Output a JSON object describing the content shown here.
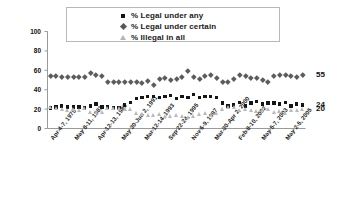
{
  "chart_data": {
    "type": "scatter",
    "title": "",
    "xlabel": "",
    "ylabel": "",
    "ylim": [
      0,
      100
    ],
    "yticks": [
      0,
      20,
      40,
      60,
      80,
      100
    ],
    "grid": false,
    "legend_position": "top-center",
    "legend_entries": [
      "% Legal under any",
      "% Legal under certain",
      "% Illegal in all"
    ],
    "x_tick_labels": [
      "Apr 4-7, 1975",
      "May 8-11, 1981",
      "Apr 12-13, 1989",
      "May 30-Jun 2, 1991",
      "Mar 12-14, 1993",
      "Sep 22-24, 1995",
      "Nov 6-9, 1997",
      "Mar 30-Apr 2, 2000",
      "Feb 8-10, 2002",
      "May 5-7, 2003",
      "May 2-5, 2005"
    ],
    "right_end_labels": [
      "55",
      "24",
      "20"
    ],
    "series": [
      {
        "name": "% Legal under any",
        "marker": "square",
        "color": "#151515",
        "values": [
          21,
          22,
          23,
          22,
          22,
          22,
          21,
          23,
          25,
          22,
          22,
          21,
          21,
          24,
          27,
          31,
          32,
          33,
          33,
          32,
          33,
          34,
          31,
          33,
          32,
          35,
          32,
          33,
          33,
          32,
          26,
          23,
          24,
          27,
          23,
          26,
          28,
          25,
          26,
          26,
          25,
          27,
          23,
          25,
          24
        ]
      },
      {
        "name": "% Legal under certain",
        "marker": "diamond",
        "color": "#5c5c5c",
        "values": [
          54,
          54,
          53,
          53,
          53,
          53,
          53,
          57,
          55,
          54,
          48,
          48,
          48,
          48,
          48,
          48,
          47,
          49,
          45,
          51,
          52,
          50,
          51,
          53,
          59,
          53,
          51,
          54,
          55,
          52,
          48,
          48,
          51,
          55,
          54,
          52,
          52,
          50,
          48,
          54,
          55,
          55,
          54,
          53,
          55
        ]
      },
      {
        "name": "% Illegal in all",
        "marker": "triangle",
        "color": "#b9b9b9",
        "values": [
          22,
          21,
          20,
          19,
          20,
          19,
          21,
          17,
          17,
          17,
          21,
          21,
          21,
          20,
          20,
          16,
          15,
          14,
          14,
          15,
          13,
          13,
          14,
          13,
          12,
          13,
          15,
          16,
          14,
          16,
          20,
          22,
          22,
          19,
          20,
          19,
          18,
          19,
          20,
          17,
          18,
          16,
          19,
          19,
          20
        ]
      }
    ]
  }
}
